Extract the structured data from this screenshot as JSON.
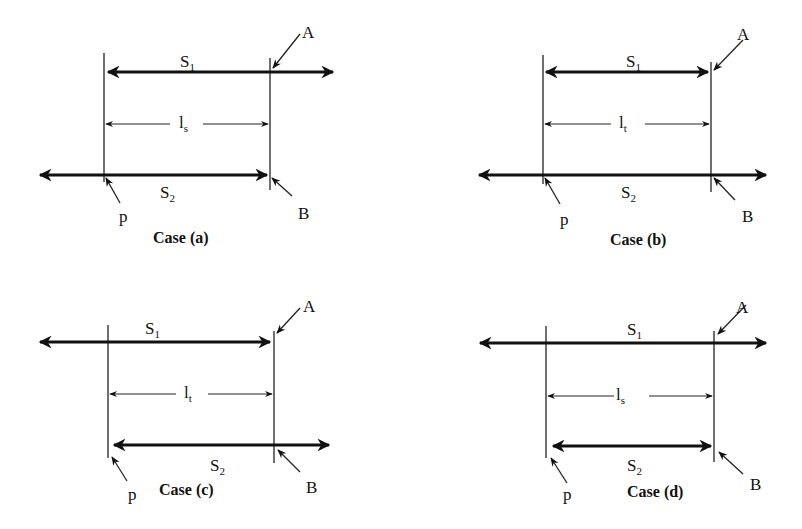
{
  "figure": {
    "cases": [
      {
        "id": "a",
        "caption": "Case (a)",
        "s1_label": "S",
        "s1_sub": "1",
        "s2_label": "S",
        "s2_sub": "2",
        "dim_label": "l",
        "dim_sub": "s",
        "point_A": "A",
        "point_B": "B",
        "point_p": "p",
        "s1_extent": "from p (arrow) to beyond A (arrow right)",
        "s2_extent": "from beyond p (arrow left) to B (arrow)"
      },
      {
        "id": "b",
        "caption": "Case (b)",
        "s1_label": "S",
        "s1_sub": "1",
        "s2_label": "S",
        "s2_sub": "2",
        "dim_label": "l",
        "dim_sub": "t",
        "point_A": "A",
        "point_B": "B",
        "point_p": "p",
        "s1_extent": "from p (arrow) to A (arrow)",
        "s2_extent": "from beyond p (arrow left) to beyond B (arrow right)"
      },
      {
        "id": "c",
        "caption": "Case (c)",
        "s1_label": "S",
        "s1_sub": "1",
        "s2_label": "S",
        "s2_sub": "2",
        "dim_label": "l",
        "dim_sub": "t",
        "point_A": "A",
        "point_B": "B",
        "point_p": "p",
        "s1_extent": "from beyond p (arrow left) to A (arrow)",
        "s2_extent": "from p (arrow) to beyond B (arrow right)"
      },
      {
        "id": "d",
        "caption": "Case (d)",
        "s1_label": "S",
        "s1_sub": "1",
        "s2_label": "S",
        "s2_sub": "2",
        "dim_label": "l",
        "dim_sub": "s",
        "point_A": "A",
        "point_B": "B",
        "point_p": "p",
        "s1_extent": "from beyond p (arrow left) to beyond A (arrow right)",
        "s2_extent": "from p (arrow) to B (arrow)"
      }
    ]
  }
}
